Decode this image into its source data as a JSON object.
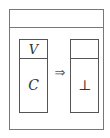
{
  "diagram": {
    "header_label": "",
    "left_box": {
      "top_label": "V",
      "bottom_label": "C"
    },
    "arrow": "⇒",
    "right_box": {
      "top_label": "",
      "bottom_label": "⊥"
    }
  }
}
